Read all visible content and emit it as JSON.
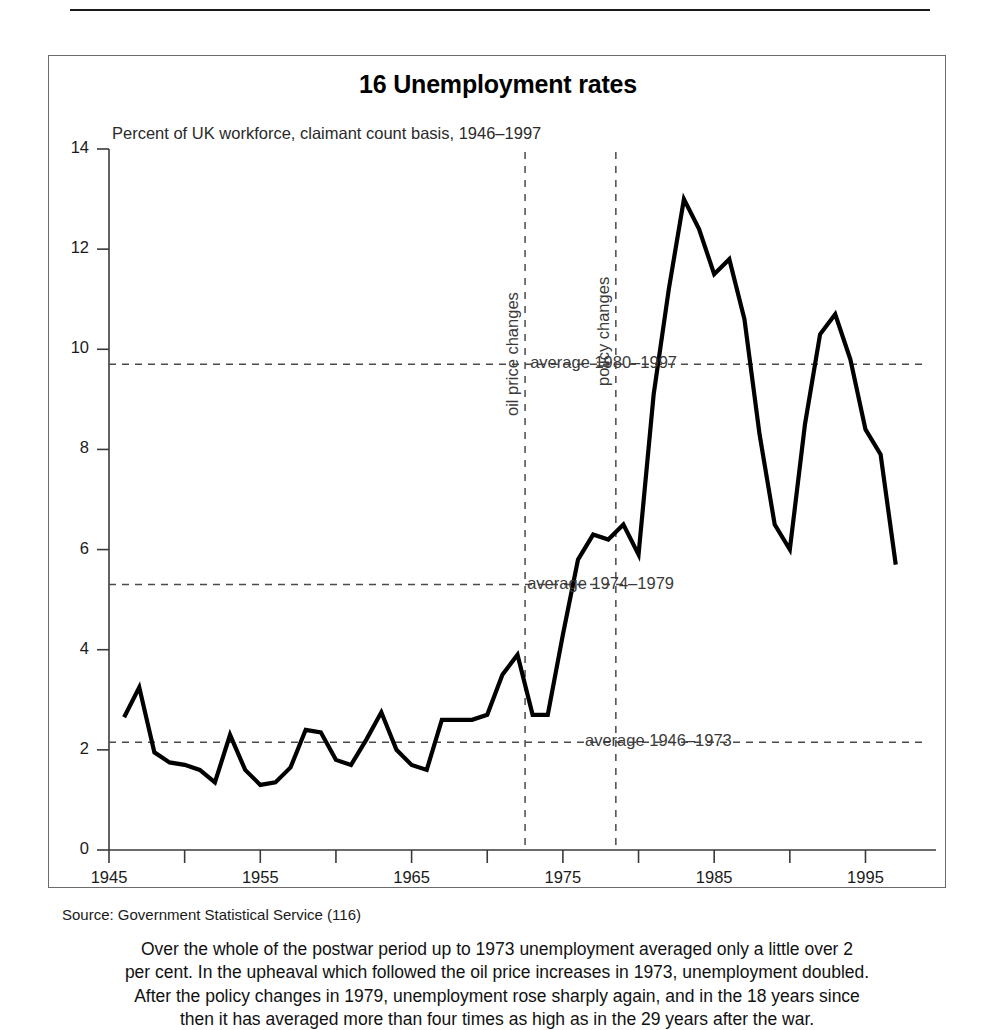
{
  "figure": {
    "title": "16 Unemployment rates",
    "subtitle": "Percent of UK workforce, claimant count basis, 1946–1997",
    "source": "Source: Government Statistical Service (116)",
    "caption_lines": [
      "Over the whole of the postwar period up to 1973 unemployment averaged only a little over 2",
      "per cent. In the upheaval which followed the oil price increases in 1973, unemployment doubled.",
      "After the policy changes in 1979, unemployment rose sharply again, and in the 18 years since",
      "then it has averaged more than four times as high as in the 29 years after the war."
    ]
  },
  "chart_data": {
    "type": "line",
    "title": "16 Unemployment rates",
    "subtitle": "Percent of UK workforce, claimant count basis, 1946–1997",
    "xlabel": "",
    "ylabel": "Percent of UK workforce",
    "xlim": [
      1945,
      1999
    ],
    "ylim": [
      0,
      14
    ],
    "yticks": [
      0,
      2,
      4,
      6,
      8,
      10,
      12,
      14
    ],
    "ytick_labels": [
      "0",
      "2",
      "4",
      "6",
      "8",
      "10",
      "12",
      "14"
    ],
    "xticks": [
      1945,
      1950,
      1955,
      1960,
      1965,
      1970,
      1975,
      1980,
      1985,
      1990,
      1995
    ],
    "xtick_labels": [
      "1945",
      "",
      "1955",
      "",
      "1965",
      "",
      "1975",
      "",
      "1985",
      "",
      "1995"
    ],
    "grid": false,
    "legend": "none",
    "x": [
      1946,
      1947,
      1948,
      1949,
      1950,
      1951,
      1952,
      1953,
      1954,
      1955,
      1956,
      1957,
      1958,
      1959,
      1960,
      1961,
      1962,
      1963,
      1964,
      1965,
      1966,
      1967,
      1968,
      1969,
      1970,
      1971,
      1972,
      1973,
      1974,
      1975,
      1976,
      1977,
      1978,
      1979,
      1980,
      1981,
      1982,
      1983,
      1984,
      1985,
      1986,
      1987,
      1988,
      1989,
      1990,
      1991,
      1992,
      1993,
      1994,
      1995,
      1996,
      1997
    ],
    "values": [
      2.65,
      3.25,
      1.95,
      1.75,
      1.7,
      1.6,
      1.35,
      2.3,
      1.6,
      1.3,
      1.35,
      1.65,
      2.4,
      2.35,
      1.8,
      1.7,
      2.2,
      2.75,
      2.0,
      1.7,
      1.6,
      2.6,
      2.6,
      2.6,
      2.7,
      3.5,
      3.9,
      2.7,
      2.7,
      4.3,
      5.8,
      6.3,
      6.2,
      6.5,
      5.9,
      9.1,
      11.2,
      13.0,
      12.4,
      11.5,
      11.8,
      10.6,
      8.3,
      6.5,
      6.0,
      8.5,
      10.3,
      10.7,
      9.8,
      8.4,
      7.9,
      5.7
    ],
    "reference_lines": [
      {
        "label": "average 1946–1973",
        "value": 2.15,
        "x_start": 1945,
        "x_end": 1999,
        "style": "dashed"
      },
      {
        "label": "average 1974–1979",
        "value": 5.3,
        "x_start": 1945,
        "x_end": 1979,
        "style": "dashed"
      },
      {
        "label": "average 1980–1997",
        "value": 9.7,
        "x_start": 1945,
        "x_end": 1999,
        "style": "dashed"
      }
    ],
    "event_lines": [
      {
        "label": "oil price changes",
        "year": 1972.5,
        "style": "dashed"
      },
      {
        "label": "policy changes",
        "year": 1978.5,
        "style": "dashed"
      }
    ]
  },
  "colors": {
    "line": "#000000",
    "axis": "#3a3a3a",
    "dashed": "#4a4a4a",
    "border": "#6b6b6b",
    "text": "#1a1a1a"
  }
}
